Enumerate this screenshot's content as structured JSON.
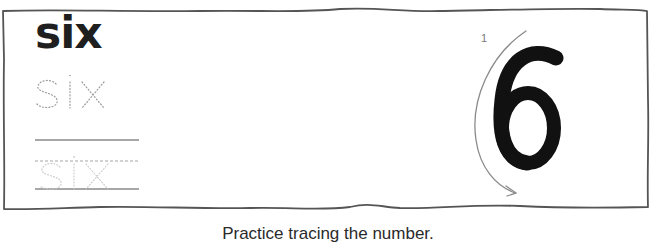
{
  "worksheet": {
    "word": "six",
    "dotted_word": "six",
    "faint_word": "six",
    "numeral": "6",
    "stroke_order_label": "1",
    "caption": "Practice tracing the number."
  },
  "colors": {
    "frame": "#555555",
    "bold_text": "#1f1f1f",
    "numeral": "#111111",
    "dotted_text": "#9a9a9a",
    "faint_text": "#c8c8c8",
    "guide_line": "#888888",
    "arrow": "#8a8a8a"
  }
}
